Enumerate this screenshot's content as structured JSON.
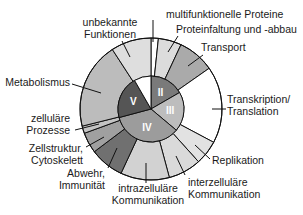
{
  "chart_data": {
    "type": "pie",
    "title": "",
    "outer_ring": {
      "unit": "degrees",
      "segments": [
        {
          "name": "multifunktionelle Proteine",
          "label_lines": [
            "multifunktionelle Proteine"
          ],
          "start": 0,
          "end": 6,
          "color": "#ffffff"
        },
        {
          "name": "Proteinfaltung und -abbau",
          "label_lines": [
            "Proteinfaltung und -abbau"
          ],
          "start": 6,
          "end": 25,
          "color": "#dcdcdc"
        },
        {
          "name": "Transport",
          "label_lines": [
            "Transport"
          ],
          "start": 25,
          "end": 55,
          "color": "#aaaaaa"
        },
        {
          "name": "Transkription/Translation",
          "label_lines": [
            "Transkription/",
            "Translation"
          ],
          "start": 55,
          "end": 118,
          "color": "#ffffff"
        },
        {
          "name": "Replikation",
          "label_lines": [
            "Replikation"
          ],
          "start": 118,
          "end": 138,
          "color": "#e2e2e2"
        },
        {
          "name": "interzelluläre Kommunikation",
          "label_lines": [
            "interzelluläre",
            "Kommunikation"
          ],
          "start": 138,
          "end": 165,
          "color": "#dadada"
        },
        {
          "name": "intrazelluläre Kommunikation",
          "label_lines": [
            "intrazelluläre",
            "Kommunikation"
          ],
          "start": 165,
          "end": 205,
          "color": "#d2d2d2"
        },
        {
          "name": "Abwehr, Immunität",
          "label_lines": [
            "Abwehr,",
            "Immunität"
          ],
          "start": 205,
          "end": 233,
          "color": "#707070"
        },
        {
          "name": "Zellstruktur, Cytoskelett",
          "label_lines": [
            "Zellstruktur,",
            "Cytoskelett"
          ],
          "start": 233,
          "end": 250,
          "color": "#a0a0a0"
        },
        {
          "name": "zelluläre Prozesse",
          "label_lines": [
            "zelluläre",
            "Prozesse"
          ],
          "start": 250,
          "end": 256,
          "color": "#c4c4c4"
        },
        {
          "name": "Metabolismus",
          "label_lines": [
            "Metabolismus"
          ],
          "start": 256,
          "end": 327,
          "color": "#bcbcbc"
        },
        {
          "name": "unbekannte Funktionen",
          "label_lines": [
            "unbekannte",
            "Funktionen"
          ],
          "start": 327,
          "end": 360,
          "color": "#dedede"
        }
      ]
    },
    "inner_pie": {
      "unit": "degrees",
      "segments": [
        {
          "name": "II",
          "start": 0,
          "end": 60,
          "color": "#7a7a7a"
        },
        {
          "name": "III",
          "start": 60,
          "end": 130,
          "color": "#bdbdbd"
        },
        {
          "name": "IV",
          "start": 130,
          "end": 255,
          "color": "#9c9c9c"
        },
        {
          "name": "V",
          "start": 255,
          "end": 330,
          "color": "#555555"
        },
        {
          "name": "",
          "start": 330,
          "end": 360,
          "color": "#ffffff"
        }
      ]
    },
    "legend": "none"
  }
}
